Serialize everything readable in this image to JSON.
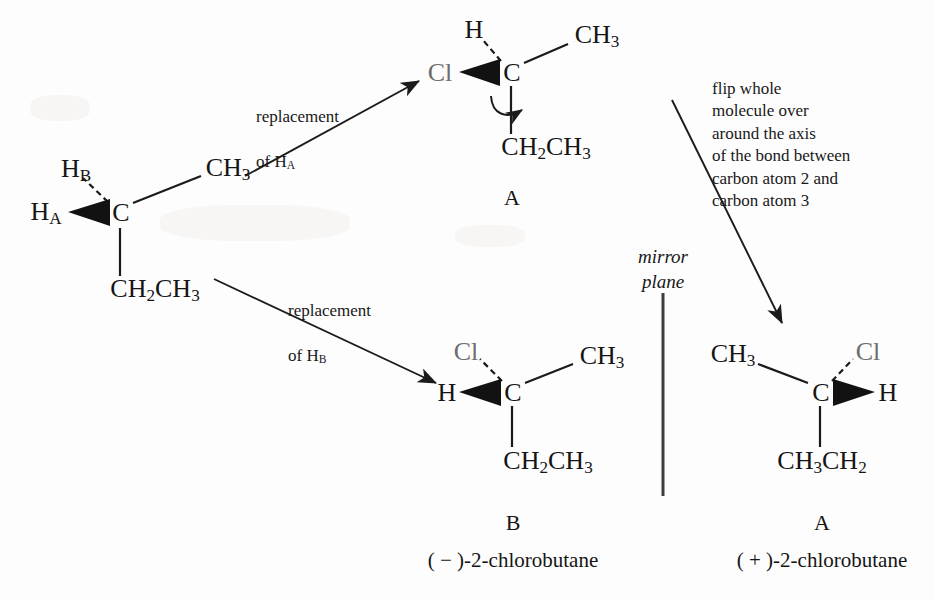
{
  "figure": {
    "kind": "chemistry-stereochemistry-diagram",
    "width": 934,
    "height": 600,
    "ink_color": "#151515",
    "cl_color": "#6d6d6d",
    "background": "#fdfdfd"
  },
  "molecules": {
    "start": {
      "center_atom": "C",
      "substituents": {
        "h_a": "H",
        "h_a_sub": "A",
        "h_b": "H",
        "h_b_sub": "B",
        "methyl": "CH",
        "methyl_sub": "3",
        "ethyl": "CH",
        "ethyl_sub_1": "2",
        "ethyl_tail": "CH",
        "ethyl_sub_2": "3"
      },
      "bond_types": {
        "h_a": "wedge",
        "h_b": "dashed",
        "methyl": "plain",
        "ethyl": "plain"
      }
    },
    "top_a": {
      "center_atom": "C",
      "tag": "A",
      "substituents": {
        "chlorine": "Cl",
        "hydrogen": "H",
        "methyl": "CH",
        "methyl_sub": "3",
        "ethyl": "CH",
        "ethyl_sub_1": "2",
        "ethyl_tail": "CH",
        "ethyl_sub_2": "3"
      },
      "bond_types": {
        "chlorine": "wedge",
        "hydrogen": "dashed",
        "methyl": "plain",
        "ethyl": "plain"
      },
      "rotation_arrow": "curved rotation about C2-C3 bond axis"
    },
    "bottom_b": {
      "center_atom": "C",
      "tag": "B",
      "caption": "( − )-2-chlorobutane",
      "substituents": {
        "hydrogen": "H",
        "chlorine": "Cl",
        "methyl": "CH",
        "methyl_sub": "3",
        "ethyl": "CH",
        "ethyl_sub_1": "2",
        "ethyl_tail": "CH",
        "ethyl_sub_2": "3"
      },
      "bond_types": {
        "hydrogen": "wedge",
        "chlorine": "dashed",
        "methyl": "plain",
        "ethyl": "plain"
      }
    },
    "bottom_a": {
      "center_atom": "C",
      "tag": "A",
      "caption": "( + )-2-chlorobutane",
      "substituents": {
        "methyl": "CH",
        "methyl_sub": "3",
        "chlorine": "Cl",
        "hydrogen": "H",
        "ethyl": "CH",
        "ethyl_sub_1": "3",
        "ethyl_tail": "CH",
        "ethyl_sub_2": "2"
      },
      "bond_types": {
        "methyl": "plain",
        "chlorine": "dashed",
        "hydrogen": "wedge",
        "ethyl": "plain"
      }
    }
  },
  "annotations": {
    "replacement_ha_line1": "replacement",
    "replacement_ha_line2": "of H",
    "replacement_ha_sub": "A",
    "replacement_hb_line1": "replacement",
    "replacement_hb_line2": "of H",
    "replacement_hb_sub": "B",
    "flip_note": "flip whole\nmolecule over\naround the axis\nof the bond between\ncarbon atom 2 and\ncarbon atom 3",
    "mirror_plane_line1": "mirror",
    "mirror_plane_line2": "plane"
  },
  "arrows": [
    {
      "name": "replacement-of-ha-arrow",
      "from": [
        245,
        176
      ],
      "to": [
        419,
        81
      ]
    },
    {
      "name": "replacement-of-hb-arrow",
      "from": [
        214,
        279
      ],
      "to": [
        436,
        383
      ]
    },
    {
      "name": "flip-molecule-arrow",
      "from": [
        672,
        100
      ],
      "to": [
        782,
        323
      ]
    }
  ],
  "mirror_plane_line": {
    "x": 663,
    "y_top": 293,
    "y_bottom": 496
  }
}
